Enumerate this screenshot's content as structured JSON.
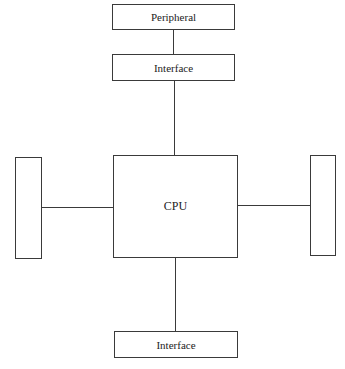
{
  "diagram": {
    "title": "",
    "nodes": {
      "peripheral": {
        "label": "Peripheral"
      },
      "interface_top": {
        "label": "Interface"
      },
      "cpu": {
        "label": "CPU"
      },
      "left_unit": {
        "label": ""
      },
      "right_unit": {
        "label": ""
      },
      "interface_bottom": {
        "label": "Interface"
      }
    },
    "edges": [
      {
        "from": "peripheral",
        "to": "interface_top"
      },
      {
        "from": "interface_top",
        "to": "cpu"
      },
      {
        "from": "left_unit",
        "to": "cpu"
      },
      {
        "from": "cpu",
        "to": "right_unit"
      },
      {
        "from": "cpu",
        "to": "interface_bottom"
      }
    ],
    "colors": {
      "stroke": "#3a3a3a",
      "background": "#ffffff"
    }
  }
}
